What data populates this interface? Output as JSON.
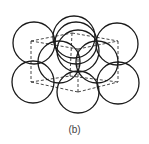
{
  "figure": {
    "caption": "(b)",
    "stroke_color": "#1a1a1a",
    "dash_color": "#333333",
    "atoms": [
      {
        "id": "back-top-center-far",
        "cx": 74,
        "cy": 37,
        "r": 21
      },
      {
        "id": "back-top-center",
        "cx": 76,
        "cy": 43,
        "r": 21
      },
      {
        "id": "top-left",
        "cx": 34,
        "cy": 43,
        "r": 21
      },
      {
        "id": "top-right",
        "cx": 117,
        "cy": 44,
        "r": 21
      },
      {
        "id": "bottom-left",
        "cx": 33,
        "cy": 82,
        "r": 21
      },
      {
        "id": "bottom-right",
        "cx": 118,
        "cy": 83,
        "r": 21
      },
      {
        "id": "middle-left",
        "cx": 59,
        "cy": 62,
        "r": 21
      },
      {
        "id": "middle-right",
        "cx": 97,
        "cy": 62,
        "r": 21
      },
      {
        "id": "bottom-front",
        "cx": 78,
        "cy": 92,
        "r": 21
      },
      {
        "id": "top-front",
        "cx": 78,
        "cy": 51,
        "r": 21
      }
    ],
    "cube_edges": [
      [
        31,
        41,
        72,
        33
      ],
      [
        72,
        33,
        118,
        41
      ],
      [
        31,
        41,
        78,
        49
      ],
      [
        78,
        49,
        118,
        41
      ],
      [
        31,
        41,
        31,
        82
      ],
      [
        118,
        41,
        118,
        82
      ],
      [
        78,
        49,
        78,
        92
      ],
      [
        72,
        33,
        70,
        76
      ],
      [
        31,
        82,
        78,
        92
      ],
      [
        78,
        92,
        118,
        82
      ],
      [
        31,
        82,
        70,
        76
      ],
      [
        70,
        76,
        118,
        82
      ]
    ]
  }
}
